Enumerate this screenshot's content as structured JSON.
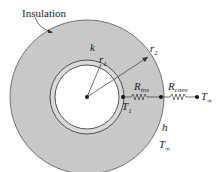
{
  "labels": {
    "insulation": "Insulation",
    "k": "k",
    "r1": "r",
    "r1_sub": "1",
    "r2": "r",
    "r2_sub": "2",
    "R_ins": "R",
    "R_ins_sub": "ins",
    "R_conv": "R",
    "R_conv_sub": "conv",
    "T1": "T",
    "T1_sub": "1",
    "T_inf": "T",
    "T_inf_sub": "∞",
    "h": "h",
    "T_inf2": "T",
    "T_inf2_sub": "∞"
  },
  "colors": {
    "insulation": "#c8c8c8",
    "outline": "#555555",
    "pipe": "#d9d9d9"
  }
}
